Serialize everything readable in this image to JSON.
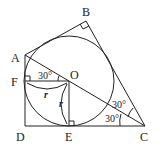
{
  "diagram": {
    "points": {
      "A": {
        "label": "A",
        "x": 25,
        "y": 55
      },
      "B": {
        "label": "B",
        "x": 86,
        "y": 21
      },
      "C": {
        "label": "C",
        "x": 145,
        "y": 126
      },
      "D": {
        "label": "D",
        "x": 25,
        "y": 126
      },
      "E": {
        "label": "E",
        "x": 69,
        "y": 126
      },
      "F": {
        "label": "F",
        "x": 25,
        "y": 81
      },
      "O": {
        "label": "O",
        "x": 69,
        "y": 81
      }
    },
    "circle": {
      "center": "O",
      "radius": 45
    },
    "angles": {
      "FOA": "30°",
      "BCA": "30°",
      "ACD": "30°"
    },
    "radius_labels": {
      "OF": "r",
      "OE": "r"
    },
    "right_angles": [
      "B",
      "F",
      "E"
    ]
  }
}
